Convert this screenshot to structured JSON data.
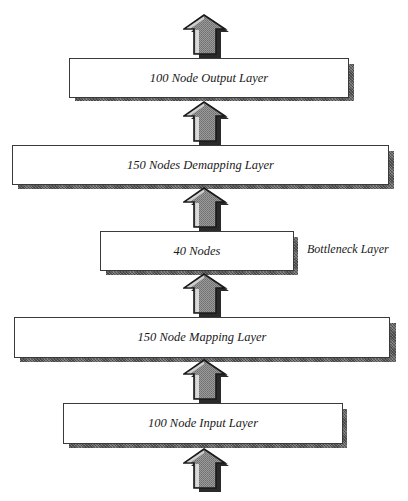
{
  "diagram": {
    "type": "autoencoder-network-architecture",
    "flow_direction": "bottom-to-top",
    "layers": [
      {
        "id": "output",
        "label": "100 Node Output Layer"
      },
      {
        "id": "demapping",
        "label": "150 Nodes Demapping Layer"
      },
      {
        "id": "bottleneck",
        "label": "40 Nodes",
        "side_label": "Bottleneck Layer"
      },
      {
        "id": "mapping",
        "label": "150 Node Mapping Layer"
      },
      {
        "id": "input",
        "label": "100 Node Input Layer"
      }
    ],
    "arrows": [
      {
        "from": "external-input",
        "to": "input",
        "icon": "up-arrow-icon"
      },
      {
        "from": "input",
        "to": "mapping",
        "icon": "up-arrow-icon"
      },
      {
        "from": "mapping",
        "to": "bottleneck",
        "icon": "up-arrow-icon"
      },
      {
        "from": "bottleneck",
        "to": "demapping",
        "icon": "up-arrow-icon"
      },
      {
        "from": "demapping",
        "to": "output",
        "icon": "up-arrow-icon"
      },
      {
        "from": "output",
        "to": "external-output",
        "icon": "up-arrow-icon"
      }
    ],
    "colors": {
      "box_fill": "#ffffff",
      "box_border": "#3a3a3a",
      "shadow": "#6b6b6b",
      "arrow_outline": "#1a1a1a",
      "arrow_fill": "#8c8c8c",
      "arrow_highlight": "#d9d9d9"
    }
  }
}
